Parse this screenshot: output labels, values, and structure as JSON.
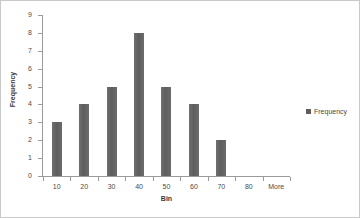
{
  "chart_data": {
    "type": "bar",
    "title": "",
    "subtitle": "",
    "categories": [
      "10",
      "20",
      "30",
      "40",
      "50",
      "60",
      "70",
      "80",
      "More"
    ],
    "values": [
      3,
      4,
      5,
      8,
      5,
      4,
      2,
      0,
      0
    ],
    "series": [
      {
        "name": "Frequency",
        "values": [
          3,
          4,
          5,
          8,
          5,
          4,
          2,
          0,
          0
        ],
        "color": "#5e5e5e"
      }
    ],
    "xlabel": "Bin",
    "ylabel": "Frequency",
    "ylim": [
      0,
      9
    ],
    "ytick_labels": [
      "9",
      "8",
      "7",
      "6",
      "5",
      "4",
      "3",
      "2",
      "1",
      "0"
    ],
    "ytick_values": [
      9,
      8,
      7,
      6,
      5,
      4,
      3,
      2,
      1,
      0
    ],
    "grid": false,
    "legend": {
      "position": "right",
      "entries": [
        {
          "label": "Frequency",
          "color": "#5e5e5e",
          "marker": "square-swatch"
        }
      ]
    },
    "plot_border_color": "#9a9a9a",
    "frame_border_color": "#c9c9c9",
    "background_color": "#ffffff"
  }
}
